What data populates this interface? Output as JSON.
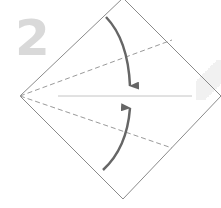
{
  "diagram": {
    "type": "origami-fold-step",
    "step_number": "2",
    "colors": {
      "outline": "#8a8a8a",
      "dashed_fold": "#9a9a9a",
      "center_line": "#c4c4c4",
      "arrow": "#666666",
      "step_number": "#d9d9d9"
    },
    "shape": {
      "kind": "square rotated 45 degrees",
      "vertices": {
        "top": [
          123,
          -2
        ],
        "right": [
          221,
          96
        ],
        "bottom": [
          123,
          199
        ],
        "left": [
          20,
          96
        ]
      }
    },
    "center_line": {
      "from": [
        58,
        96
      ],
      "to": [
        192,
        96
      ]
    },
    "valley_folds": [
      {
        "from": [
          20,
          96
        ],
        "to": [
          172,
          40
        ],
        "style": "dashed"
      },
      {
        "from": [
          20,
          96
        ],
        "to": [
          172,
          148
        ],
        "style": "dashed"
      }
    ],
    "arrows": [
      {
        "direction": "down",
        "description": "fold upper edge down to center line"
      },
      {
        "direction": "up",
        "description": "fold lower edge up to center line"
      }
    ]
  }
}
